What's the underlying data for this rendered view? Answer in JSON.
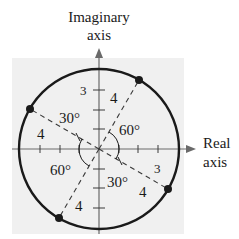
{
  "axes": {
    "imaginary_label_line1": "Imaginary",
    "imaginary_label_line2": "axis",
    "real_label_line1": "Real",
    "real_label_line2": "axis",
    "tick_label_imag": "3",
    "tick_label_real": "3"
  },
  "circle": {
    "radius_label": "4"
  },
  "radius_labels": [
    "4",
    "4",
    "4",
    "4"
  ],
  "angle_labels": {
    "upper_left": "30°",
    "upper_right": "60°",
    "lower_left": "60°",
    "lower_right": "30°"
  },
  "colors": {
    "stroke": "#1a1a1a",
    "grid_bg": "#f0f0f0",
    "axis": "#6a6a6a"
  }
}
